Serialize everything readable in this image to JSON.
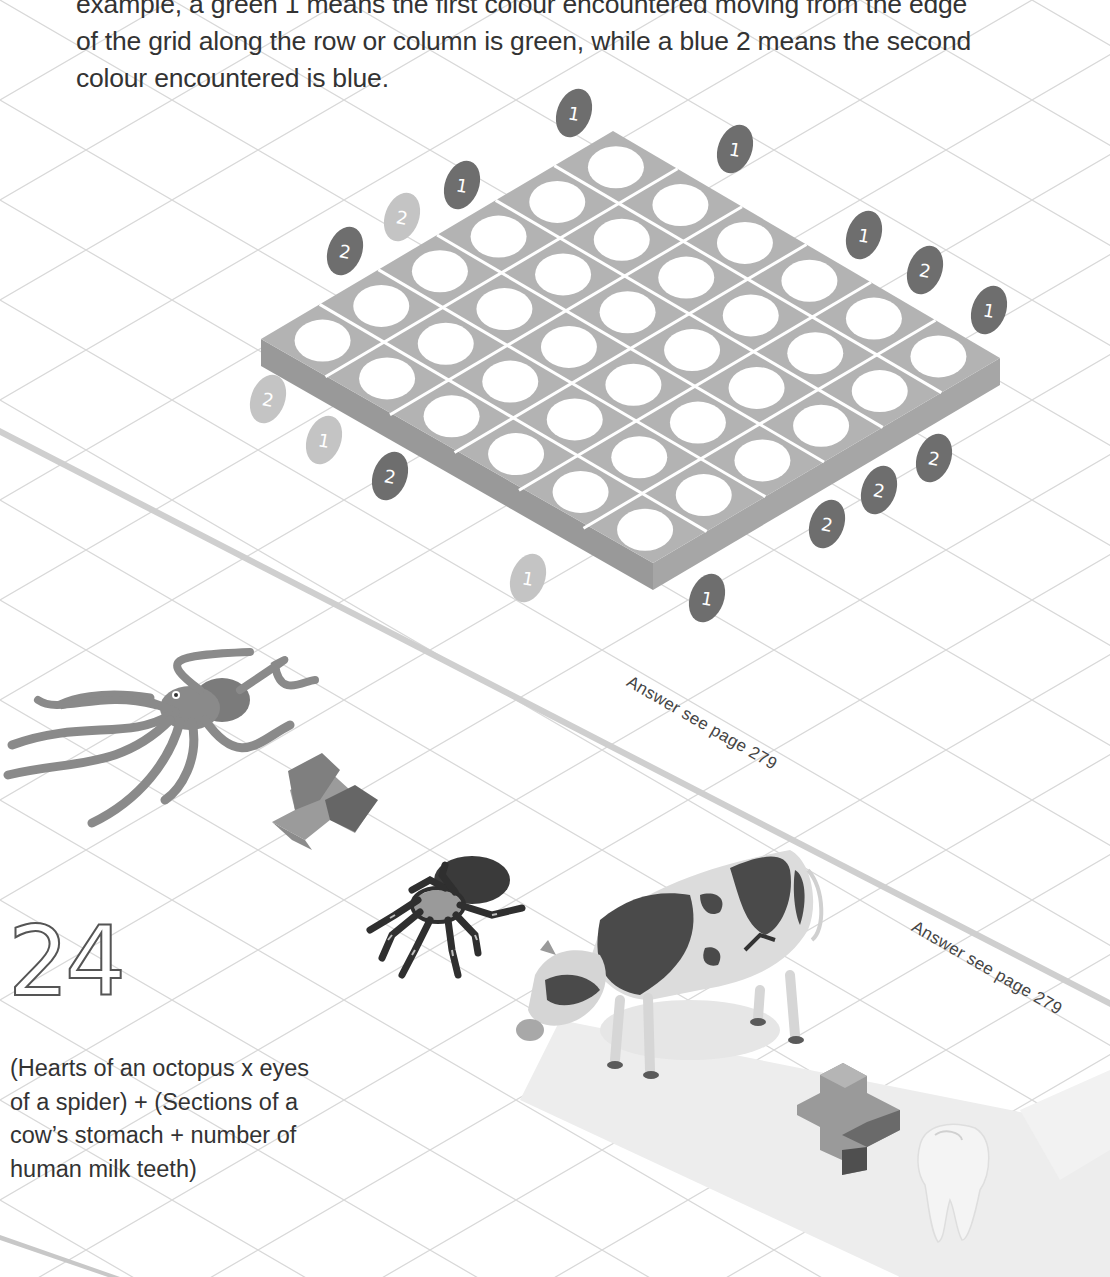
{
  "intro": {
    "lines": [
      "example, a green 1 means the first colour encountered moving from the edge",
      "of the grid along the row or column is green, while a blue 2 means the second",
      "colour encountered is blue."
    ]
  },
  "grid_puzzle": {
    "rows": 6,
    "cols": 6,
    "cell_state": "empty",
    "colors": {
      "board_top": "#b3b3b3",
      "board_side": "#999999",
      "cell_hole": "#ffffff",
      "clue_dark": "#6e6e6e",
      "clue_light": "#c4c4c4"
    },
    "clues": [
      {
        "value": "1",
        "tone": "dark",
        "x": 574,
        "y": 113
      },
      {
        "value": "1",
        "tone": "dark",
        "x": 735,
        "y": 149
      },
      {
        "value": "1",
        "tone": "dark",
        "x": 462,
        "y": 185
      },
      {
        "value": "2",
        "tone": "light",
        "x": 402,
        "y": 217
      },
      {
        "value": "2",
        "tone": "dark",
        "x": 345,
        "y": 251
      },
      {
        "value": "1",
        "tone": "dark",
        "x": 864,
        "y": 235
      },
      {
        "value": "2",
        "tone": "dark",
        "x": 925,
        "y": 270
      },
      {
        "value": "1",
        "tone": "dark",
        "x": 989,
        "y": 310
      },
      {
        "value": "2",
        "tone": "light",
        "x": 268,
        "y": 399
      },
      {
        "value": "1",
        "tone": "light",
        "x": 324,
        "y": 440
      },
      {
        "value": "2",
        "tone": "dark",
        "x": 390,
        "y": 476
      },
      {
        "value": "1",
        "tone": "light",
        "x": 528,
        "y": 578
      },
      {
        "value": "1",
        "tone": "dark",
        "x": 707,
        "y": 598
      },
      {
        "value": "2",
        "tone": "dark",
        "x": 827,
        "y": 524
      },
      {
        "value": "2",
        "tone": "dark",
        "x": 879,
        "y": 490
      },
      {
        "value": "2",
        "tone": "dark",
        "x": 934,
        "y": 458
      }
    ]
  },
  "answers": [
    {
      "text": "Answer see page 279"
    },
    {
      "text": "Answer see page 279"
    }
  ],
  "puzzle_24": {
    "number": "24",
    "question_lines": [
      "(Hearts of an octopus x eyes",
      "of a spider) + (Sections of a",
      "cow’s stomach + number of",
      "human milk teeth)"
    ],
    "illustrations": [
      "octopus",
      "multiply-sign",
      "spider",
      "cow",
      "plus-sign",
      "tooth"
    ]
  }
}
